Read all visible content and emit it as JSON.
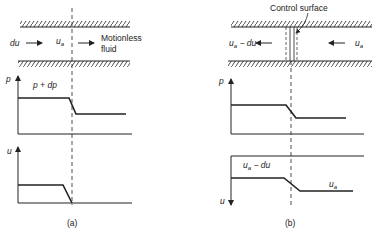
{
  "panel_a": {
    "caption": "(a)",
    "flow": {
      "left_label": "du",
      "mid_label": "u",
      "mid_sub": "a",
      "right_label_line1": "Motionless",
      "right_label_line2": "fluid"
    },
    "pressure_plot": {
      "axis_label": "p",
      "high_label": "p + dp"
    },
    "velocity_plot": {
      "axis_label": "u"
    }
  },
  "panel_b": {
    "caption": "(b)",
    "control_surface_label": "Control surface",
    "flow": {
      "left_label": "u",
      "left_sub": "a",
      "left_suffix": " − du",
      "right_label": "u",
      "right_sub": "a"
    },
    "pressure_plot": {
      "axis_label": "p"
    },
    "velocity_plot": {
      "axis_label": "u",
      "high_label": "u",
      "high_sub": "a",
      "high_suffix": " − du",
      "low_label": "u",
      "low_sub": "a"
    }
  },
  "colors": {
    "ink": "#222222",
    "background": "#ffffff"
  }
}
